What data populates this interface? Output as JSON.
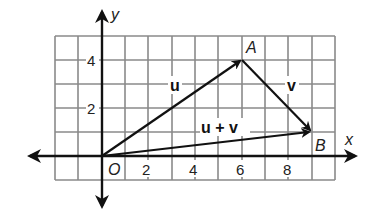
{
  "diagram": {
    "type": "vector-addition-coordinate-plane",
    "axes": {
      "x_label": "x",
      "y_label": "y",
      "origin_label": "O",
      "x_ticks": [
        "2",
        "4",
        "6",
        "8"
      ],
      "y_ticks": [
        "2",
        "4"
      ],
      "x_range": [
        -2,
        10
      ],
      "y_range": [
        -1,
        5
      ]
    },
    "points": {
      "origin": {
        "label": "O",
        "x": 0,
        "y": 0
      },
      "A": {
        "label": "A",
        "x": 6,
        "y": 4
      },
      "B": {
        "label": "B",
        "x": 9,
        "y": 1
      }
    },
    "vectors": [
      {
        "name": "u",
        "label": "u",
        "from": [
          0,
          0
        ],
        "to": [
          6,
          4
        ]
      },
      {
        "name": "v",
        "label": "v",
        "from": [
          6,
          4
        ],
        "to": [
          9,
          1
        ]
      },
      {
        "name": "u+v",
        "label": "u + v",
        "from": [
          0,
          0
        ],
        "to": [
          9,
          1
        ]
      }
    ],
    "colors": {
      "grid": "#8a8a8a",
      "axis": "#111111",
      "vector": "#111111",
      "background": "#ffffff"
    }
  }
}
